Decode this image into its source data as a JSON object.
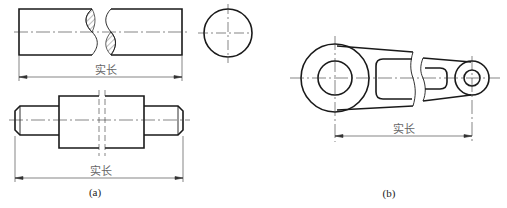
{
  "figure_a": {
    "caption": "(a)",
    "top_dimension_label": "实长",
    "bottom_dimension_label": "实长"
  },
  "figure_b": {
    "caption": "(b)",
    "dimension_label": "实长"
  },
  "colors": {
    "line": "#1a1a1a",
    "thin": "#444444",
    "background": "#ffffff"
  }
}
